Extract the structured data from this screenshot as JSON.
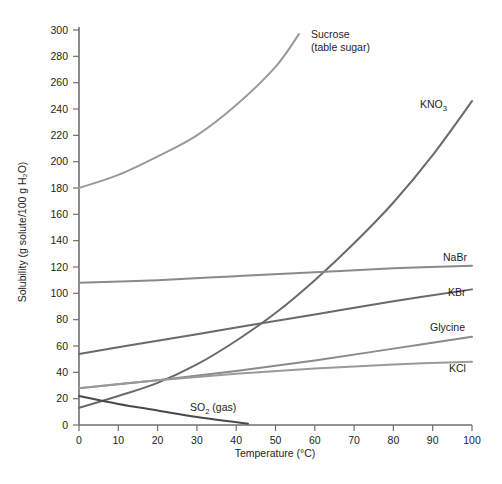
{
  "chart_data": {
    "type": "line",
    "title": "",
    "xlabel": "Temperature (°C)",
    "ylabel": "Solubility (g solute/100 g H₂O)",
    "xlim": [
      0,
      100
    ],
    "ylim": [
      0,
      300
    ],
    "grid": false,
    "legend_position": "inline-right-of-curve",
    "xticks": [
      "0",
      "10",
      "20",
      "30",
      "40",
      "50",
      "60",
      "70",
      "80",
      "90",
      "100"
    ],
    "yticks": [
      "0",
      "20",
      "40",
      "60",
      "80",
      "100",
      "120",
      "140",
      "160",
      "180",
      "200",
      "220",
      "240",
      "260",
      "280",
      "300"
    ],
    "series": [
      {
        "name": "Sucrose (table sugar)",
        "label_line1": "Sucrose",
        "label_line2": "(table sugar)",
        "color": "#9a9a9a",
        "x": [
          0,
          10,
          20,
          30,
          40,
          50,
          56
        ],
        "values": [
          180,
          190,
          204,
          220,
          243,
          272,
          297
        ]
      },
      {
        "name": "KNO3",
        "label_base": "KNO",
        "label_sub": "3",
        "color": "#6a6a6a",
        "x": [
          0,
          10,
          20,
          30,
          40,
          50,
          60,
          70,
          80,
          90,
          100
        ],
        "values": [
          13,
          22,
          32,
          46,
          64,
          85,
          110,
          138,
          169,
          205,
          246
        ]
      },
      {
        "name": "NaBr",
        "label_base": "NaBr",
        "color": "#8a8a8a",
        "x": [
          0,
          20,
          40,
          60,
          80,
          100
        ],
        "values": [
          108,
          110,
          113,
          116,
          119,
          121
        ]
      },
      {
        "name": "KBr",
        "label_base": "KBr",
        "color": "#6a6a6a",
        "x": [
          0,
          20,
          40,
          60,
          80,
          100
        ],
        "values": [
          54,
          64,
          74,
          84,
          94,
          103
        ]
      },
      {
        "name": "Glycine",
        "label_base": "Glycine",
        "color": "#8a8a8a",
        "x": [
          0,
          20,
          40,
          60,
          80,
          100
        ],
        "values": [
          28,
          34,
          41,
          49,
          58,
          67
        ]
      },
      {
        "name": "KCl",
        "label_base": "KCl",
        "color": "#9a9a9a",
        "x": [
          0,
          20,
          40,
          60,
          80,
          100
        ],
        "values": [
          28,
          34,
          39,
          43,
          46,
          48
        ]
      },
      {
        "name": "SO2 (gas)",
        "label_base": "SO",
        "label_sub": "2",
        "label_tail": " (gas)",
        "color": "#4a4a4a",
        "x": [
          0,
          10,
          20,
          30,
          43
        ],
        "values": [
          22,
          16,
          11,
          6,
          1
        ]
      }
    ],
    "annotations": [
      {
        "name": "sucrose-label",
        "text": "Sucrose (table sugar)",
        "x_px": 311,
        "y_px": 38
      },
      {
        "name": "kno3-label",
        "text": "KNO3",
        "x_px": 420,
        "y_px": 108
      },
      {
        "name": "nabr-label",
        "text": "NaBr",
        "x_px": 443,
        "y_px": 261
      },
      {
        "name": "kbr-label",
        "text": "KBr",
        "x_px": 448,
        "y_px": 296
      },
      {
        "name": "glycine-label",
        "text": "Glycine",
        "x_px": 430,
        "y_px": 331
      },
      {
        "name": "kcl-label",
        "text": "KCl",
        "x_px": 449,
        "y_px": 372
      },
      {
        "name": "so2-label",
        "text": "SO2 (gas)",
        "x_px": 190,
        "y_px": 410
      }
    ]
  }
}
